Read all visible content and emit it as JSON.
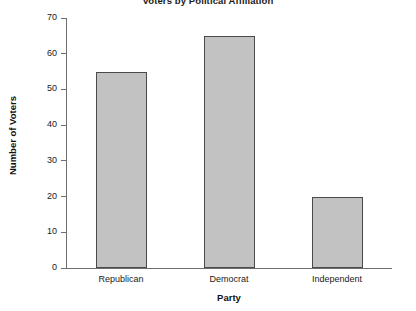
{
  "chart_data": {
    "type": "bar",
    "title": "Voters by Political Affiliation",
    "xlabel": "Party",
    "ylabel": "Number of Voters",
    "categories": [
      "Republican",
      "Democrat",
      "Independent"
    ],
    "values": [
      55,
      65,
      20
    ],
    "ylim": [
      0,
      70
    ],
    "yticks": [
      0,
      10,
      20,
      30,
      40,
      50,
      60,
      70
    ],
    "ytick_labels": [
      "0",
      "10",
      "20",
      "30",
      "40",
      "50",
      "60",
      "70"
    ],
    "grid": false,
    "legend": null,
    "bar_color": "#c2c2c2",
    "bar_edge_color": "#4a4a4a",
    "axis_color": "#6e6e6e",
    "background_color": "#ffffff"
  }
}
